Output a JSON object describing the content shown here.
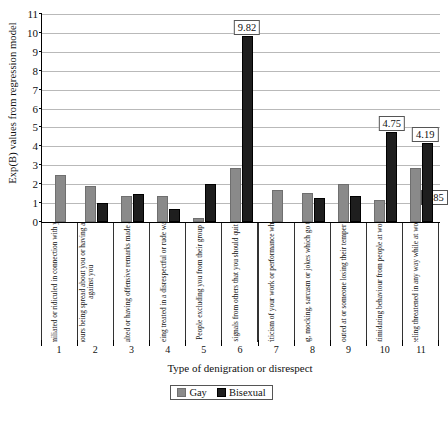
{
  "chart_data": {
    "type": "bar",
    "title": "",
    "xlabel": "Type of denigration or disrespect",
    "ylabel": "Exp(B) values from regression model",
    "ylim": [
      0,
      11
    ],
    "yticks": [
      0,
      1,
      2,
      3,
      4,
      5,
      6,
      7,
      8,
      9,
      10,
      11
    ],
    "grid": true,
    "legend_position": "bottom",
    "category_numbers": [
      "1",
      "2",
      "3",
      "4",
      "5",
      "6",
      "7",
      "8",
      "9",
      "10",
      "11"
    ],
    "categories": [
      "Being humiliated or ridiculed in connection with your work",
      "Gossip and rumours being spread about you or having allegations made against you",
      "Being insulted or having offensive remarks made about you",
      "Being treated in a disrespectful or rude way",
      "People excluding you from their group",
      "Hints or signals from others that you should quit your job",
      "Persistent criticism of your work or performance which is unfair",
      "Teasing, mocking, sarcasm or jokes which go too far",
      "Being shouted at or someone losing their temper with you",
      "Intimidating behaviour from people at work",
      "Feeling threatened in any way while at work"
    ],
    "series": [
      {
        "name": "Gay",
        "color": "#8a8a8a",
        "values": [
          2.5,
          1.9,
          1.4,
          1.4,
          0.2,
          2.85,
          1.7,
          1.52,
          2.02,
          1.15,
          2.85
        ],
        "labels": [
          "",
          "",
          "",
          "",
          "",
          "",
          "",
          "",
          "",
          "",
          "2.85"
        ]
      },
      {
        "name": "Bisexual",
        "color": "#1e1e1e",
        "values": [
          null,
          1.02,
          1.5,
          0.68,
          2.02,
          9.82,
          null,
          1.25,
          1.4,
          4.75,
          4.19
        ],
        "labels": [
          "",
          "",
          "",
          "",
          "",
          "9.82",
          "",
          "",
          "",
          "4.75",
          "4.19"
        ]
      }
    ]
  },
  "legend": {
    "items": [
      {
        "label": "Gay",
        "swatch": "gay"
      },
      {
        "label": "Bisexual",
        "swatch": "bi"
      }
    ]
  }
}
